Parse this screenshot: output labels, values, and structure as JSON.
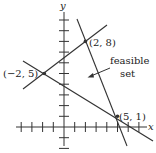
{
  "diagram": {
    "type": "linear-programming-feasible-region",
    "axes": {
      "x_label": "x",
      "y_label": "y",
      "x_ticks": [
        -4,
        -3,
        -2,
        -1,
        1,
        2,
        3,
        4,
        5,
        6,
        7
      ],
      "y_ticks": [
        -2,
        -1,
        1,
        2,
        3,
        4,
        5,
        6,
        7,
        8,
        9,
        10
      ]
    },
    "vertices": [
      {
        "label": "(−2, 5)",
        "x": -2,
        "y": 5
      },
      {
        "label": "(2, 8)",
        "x": 2,
        "y": 8
      },
      {
        "label": "(5, 1)",
        "x": 5,
        "y": 1
      }
    ],
    "annotation": {
      "line1": "feasible",
      "line2": "set"
    },
    "colors": {
      "line": "#333333",
      "background": "#ffffff"
    }
  }
}
